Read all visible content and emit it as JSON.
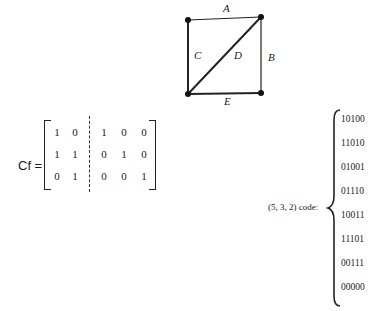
{
  "graph": {
    "edges": [
      {
        "label": "A"
      },
      {
        "label": "B"
      },
      {
        "label": "C"
      },
      {
        "label": "D"
      },
      {
        "label": "E"
      }
    ]
  },
  "matrix": {
    "label": "Cf =",
    "rows": [
      [
        "1",
        "0",
        "1",
        "0",
        "0"
      ],
      [
        "1",
        "1",
        "0",
        "1",
        "0"
      ],
      [
        "0",
        "1",
        "0",
        "0",
        "1"
      ]
    ]
  },
  "code": {
    "label": "(5, 3, 2) code:",
    "words": [
      "10100",
      "11010",
      "01001",
      "01110",
      "10011",
      "11101",
      "00111",
      "00000"
    ]
  }
}
